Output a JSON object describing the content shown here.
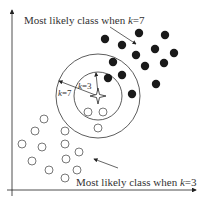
{
  "diagram": {
    "colors": {
      "ink": "#222222",
      "filled_class": "#1a1a1a",
      "hollow_class": "#555555",
      "background": "#ffffff"
    },
    "annotations": {
      "top_label_prefix": "Most likely class when ",
      "top_label_k": "k",
      "top_label_suffix": "=7",
      "bottom_label_prefix": "Most likely class when ",
      "bottom_label_k": "k",
      "bottom_label_suffix": "=3",
      "outer_radius_k": "k",
      "outer_radius_value": "=7",
      "inner_radius_k": "k",
      "inner_radius_value": "=3"
    },
    "test_point": {
      "x": 98,
      "y": 96,
      "marker": "four-point-star"
    },
    "circles": {
      "inner": {
        "k": 3,
        "cx": 98,
        "cy": 96,
        "r": 24
      },
      "outer": {
        "k": 7,
        "cx": 98,
        "cy": 96,
        "r": 42
      }
    },
    "filled_points": [
      [
        105,
        39
      ],
      [
        139,
        33
      ],
      [
        165,
        35
      ],
      [
        122,
        45
      ],
      [
        136,
        55
      ],
      [
        155,
        49
      ],
      [
        174,
        53
      ],
      [
        113,
        62
      ],
      [
        145,
        66
      ],
      [
        164,
        63
      ],
      [
        122,
        75
      ],
      [
        108,
        78
      ],
      [
        156,
        84
      ],
      [
        132,
        94
      ]
    ],
    "hollow_points": [
      [
        88,
        112
      ],
      [
        103,
        112
      ],
      [
        44,
        119
      ],
      [
        35,
        131
      ],
      [
        22,
        144
      ],
      [
        42,
        147
      ],
      [
        65,
        131
      ],
      [
        65,
        144
      ],
      [
        79,
        152
      ],
      [
        32,
        161
      ],
      [
        66,
        159
      ],
      [
        49,
        170
      ],
      [
        77,
        170
      ],
      [
        65,
        178
      ],
      [
        98,
        128
      ]
    ]
  }
}
